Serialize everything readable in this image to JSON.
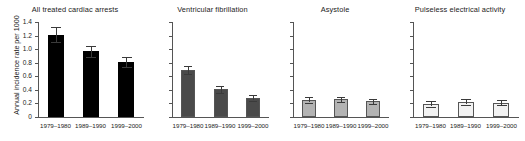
{
  "figure": {
    "ylabel": "Annual incidence rate per 1000",
    "y_ticks": [
      "0",
      "0.2",
      "0.4",
      "0.6",
      "0.8",
      "1.0",
      "1.2",
      "1.4"
    ]
  },
  "chart_data": {
    "type": "bar",
    "title": "",
    "xlabel": "",
    "ylabel": "Annual incidence rate per 1000",
    "ylim": [
      0,
      1.4
    ],
    "ytick_values": [
      0,
      0.2,
      0.4,
      0.6,
      0.8,
      1.0,
      1.2,
      1.4
    ],
    "grid": false,
    "legend": "none",
    "categories": [
      "1979–1980",
      "1989–1990",
      "1999–2000"
    ],
    "panels": [
      {
        "title": "All treated cardiac arrests",
        "color": "#000000",
        "values": [
          1.21,
          0.97,
          0.81
        ],
        "err_low": [
          0.11,
          0.08,
          0.08
        ],
        "err_high": [
          0.11,
          0.08,
          0.08
        ]
      },
      {
        "title": "Ventricular fibrillation",
        "color": "#4a4a4a",
        "values": [
          0.69,
          0.41,
          0.28
        ],
        "err_low": [
          0.06,
          0.05,
          0.04
        ],
        "err_high": [
          0.06,
          0.05,
          0.04
        ]
      },
      {
        "title": "Asystole",
        "color": "#b3b3b3",
        "values": [
          0.25,
          0.26,
          0.23
        ],
        "err_low": [
          0.04,
          0.04,
          0.04
        ],
        "err_high": [
          0.04,
          0.04,
          0.04
        ]
      },
      {
        "title": "Pulseless electrical activity",
        "color": "#f2f2f2",
        "values": [
          0.19,
          0.22,
          0.21
        ],
        "err_low": [
          0.04,
          0.04,
          0.04
        ],
        "err_high": [
          0.04,
          0.04,
          0.04
        ]
      }
    ]
  }
}
